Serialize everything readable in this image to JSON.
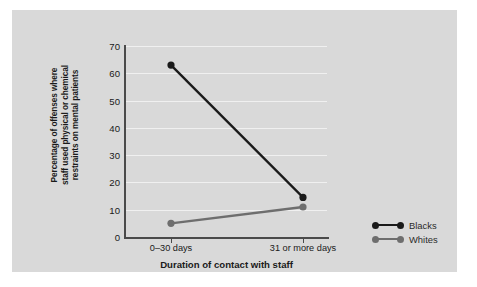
{
  "chart_data": {
    "type": "line",
    "title": "",
    "categories": [
      "0–30 days",
      "31 or more days"
    ],
    "series": [
      {
        "name": "Blacks",
        "values": [
          63,
          14.5
        ],
        "color": "#1a1a1a"
      },
      {
        "name": "Whites",
        "values": [
          5,
          11
        ],
        "color": "#6e6e6e"
      }
    ],
    "xlabel": "Duration of contact with staff",
    "ylabel": "Percentage of offenses where\nstaff used physical or chemical\nrestraints on mental patients",
    "ylim": [
      0,
      70
    ],
    "yticks": [
      0,
      10,
      20,
      30,
      40,
      50,
      60,
      70
    ],
    "ytick_labels": [
      "0",
      "10",
      "20",
      "30",
      "40",
      "50",
      "60",
      "70"
    ],
    "grid": true,
    "legend_position": "right",
    "legend_entries": [
      "Blacks",
      "Whites"
    ],
    "plot_background": "#d9d9d9",
    "gridline_color": "#f0f0f0",
    "axis_color": "#4a4a4a"
  }
}
